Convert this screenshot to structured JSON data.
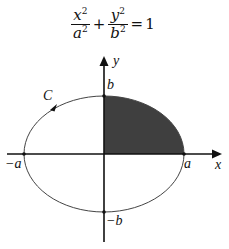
{
  "equation": {
    "term1": {
      "numerator": "x",
      "numerator_exp": "2",
      "denominator": "a",
      "denominator_exp": "2"
    },
    "plus": "+",
    "term2": {
      "numerator": "y",
      "numerator_exp": "2",
      "denominator": "b",
      "denominator_exp": "2"
    },
    "equals": "=",
    "rhs": "1"
  },
  "labels": {
    "y_axis": "y",
    "x_axis": "x",
    "top": "b",
    "bottom": "−b",
    "left": "−a",
    "right": "a",
    "curve": "C"
  },
  "colors": {
    "axis": "#111111",
    "ellipse": "#444444",
    "shaded_quadrant": "#3f3f3f",
    "background": "#ffffff"
  },
  "geometry": {
    "center": [
      104,
      154
    ],
    "rx": 80,
    "ry": 58,
    "shaded_region": "first quadrant of ellipse",
    "orientation_arrow": "counterclockwise on upper-left arc"
  }
}
